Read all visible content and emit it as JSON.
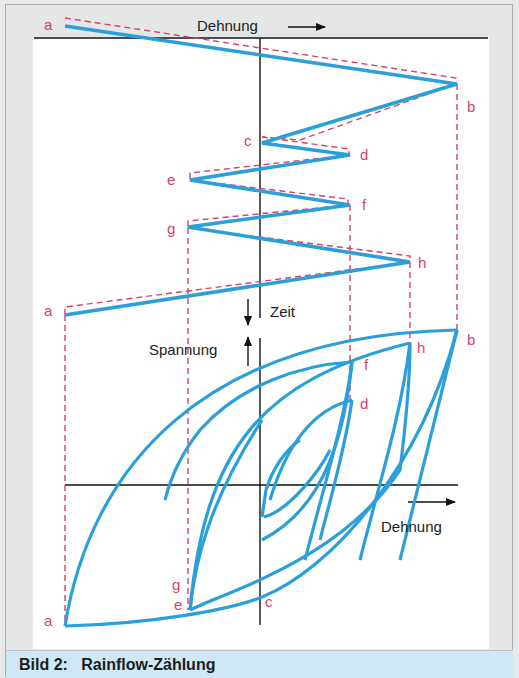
{
  "figure": {
    "caption": "Bild 2:   Rainflow-Zählung",
    "colors": {
      "curve": "#2a9fd9",
      "dashed": "#d6416b",
      "axis": "#111111",
      "caption_bg": "#cfe9f4",
      "frame_bg": "#e4e6e7"
    }
  },
  "time_plot": {
    "x_axis_label": "Dehnung",
    "y_axis_label": "Zeit",
    "turning_points": [
      {
        "label": "a",
        "x": 65,
        "y": 26
      },
      {
        "label": "b",
        "x": 457,
        "y": 84
      },
      {
        "label": "c",
        "x": 262,
        "y": 143
      },
      {
        "label": "d",
        "x": 350,
        "y": 155
      },
      {
        "label": "e",
        "x": 190,
        "y": 180
      },
      {
        "label": "f",
        "x": 350,
        "y": 205
      },
      {
        "label": "g",
        "x": 188,
        "y": 227
      },
      {
        "label": "h",
        "x": 410,
        "y": 262
      },
      {
        "label": "a",
        "x": 65,
        "y": 315
      }
    ]
  },
  "hysteresis_plot": {
    "x_axis_label": "Dehnung",
    "y_axis_label": "Spannung",
    "points": [
      {
        "label": "b",
        "x": 457,
        "y": 330
      },
      {
        "label": "h",
        "x": 410,
        "y": 343
      },
      {
        "label": "f",
        "x": 352,
        "y": 362
      },
      {
        "label": "d",
        "x": 352,
        "y": 400
      },
      {
        "label": "c",
        "x": 262,
        "y": 517
      },
      {
        "label": "g",
        "x": 186,
        "y": 582
      },
      {
        "label": "e",
        "x": 190,
        "y": 610
      },
      {
        "label": "a",
        "x": 65,
        "y": 626
      }
    ]
  },
  "labels": {
    "top_dehnung": "Dehnung",
    "zeit": "Zeit",
    "spannung": "Spannung",
    "bottom_dehnung": "Dehnung",
    "a_top": "a",
    "b_top": "b",
    "c_top": "c",
    "d_top": "d",
    "e_top": "e",
    "f_top": "f",
    "g_top": "g",
    "h_top": "h",
    "a_mid": "a",
    "b_hys": "b",
    "h_hys": "h",
    "f_hys": "f",
    "d_hys": "d",
    "c_hys": "c",
    "g_hys": "g",
    "e_hys": "e",
    "a_hys": "a"
  }
}
